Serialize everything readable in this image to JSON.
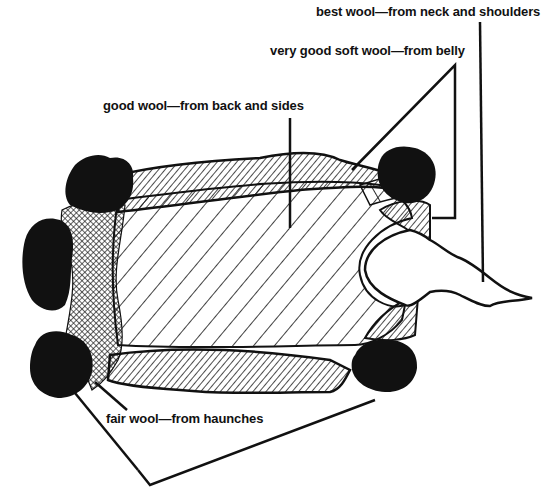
{
  "diagram": {
    "colors": {
      "ink": "#111111",
      "background": "#ffffff"
    },
    "labels": [
      {
        "id": "best",
        "text": "best wool—from neck and shoulders"
      },
      {
        "id": "very-good",
        "text": "very good soft wool—from belly"
      },
      {
        "id": "good",
        "text": "good wool—from back and sides"
      },
      {
        "id": "fair",
        "text": "fair wool—from haunches"
      }
    ],
    "regions": [
      {
        "name": "best",
        "pattern": "none (white neck area)"
      },
      {
        "name": "very-good",
        "pattern": "dense diagonal hatch"
      },
      {
        "name": "good",
        "pattern": "wide diagonal hatch"
      },
      {
        "name": "fair",
        "pattern": "cross hatch"
      },
      {
        "name": "legs",
        "pattern": "solid black"
      }
    ]
  }
}
